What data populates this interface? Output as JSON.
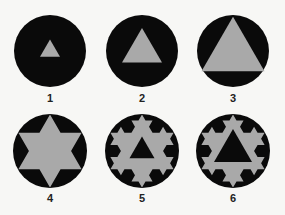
{
  "colors": {
    "background": "#f7f7f5",
    "disc": "#0a0a0a",
    "fill_gray": "#a9a9a9",
    "label": "#222222"
  },
  "figures": [
    {
      "label": "1",
      "cx": 50,
      "cy": 51,
      "r": 36,
      "shape": "triangle",
      "size": 20,
      "triangle_color": "gray"
    },
    {
      "label": "2",
      "cx": 142,
      "cy": 51,
      "r": 36,
      "shape": "triangle",
      "size": 40,
      "triangle_color": "gray"
    },
    {
      "label": "3",
      "cx": 233,
      "cy": 51,
      "r": 36,
      "shape": "triangle",
      "size": 63,
      "triangle_color": "gray"
    },
    {
      "label": "4",
      "cx": 50,
      "cy": 151,
      "r": 37,
      "shape": "koch",
      "koch_iterations": 1,
      "inner_triangle_size": 0
    },
    {
      "label": "5",
      "cx": 142,
      "cy": 151,
      "r": 37,
      "shape": "koch",
      "koch_iterations": 2,
      "inner_triangle_size": 25
    },
    {
      "label": "6",
      "cx": 233,
      "cy": 151,
      "r": 37,
      "shape": "koch",
      "koch_iterations": 2,
      "inner_triangle_size": 38
    }
  ],
  "label_offset_y": 47
}
